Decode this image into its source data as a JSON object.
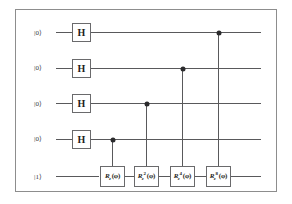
{
  "figure": {
    "kind": "quantum-circuit-diagram",
    "title": "",
    "frame": {
      "border_color": "#8d8d8d",
      "background": "#ffffff"
    },
    "wire_color": "#59595b",
    "gate_border_color": "#6a6a6c",
    "dot_color": "#2b2b2d"
  },
  "qubits": [
    {
      "index": 0,
      "label": "|0⟩",
      "y": 32
    },
    {
      "index": 1,
      "label": "|0⟩",
      "y": 67
    },
    {
      "index": 2,
      "label": "|0⟩",
      "y": 103
    },
    {
      "index": 3,
      "label": "|0⟩",
      "y": 138
    },
    {
      "index": 4,
      "label": "|1⟩",
      "y": 176
    }
  ],
  "hadamard_gates": [
    {
      "id": "h-q0",
      "label": "H",
      "qubit": 0,
      "x": 66,
      "y": 32
    },
    {
      "id": "h-q1",
      "label": "H",
      "qubit": 1,
      "x": 66,
      "y": 67
    },
    {
      "id": "h-q2",
      "label": "H",
      "qubit": 2,
      "x": 66,
      "y": 103
    },
    {
      "id": "h-q3",
      "label": "H",
      "qubit": 3,
      "x": 66,
      "y": 138
    }
  ],
  "controlled_gates": [
    {
      "id": "crz-1",
      "symbol": "R",
      "subscript": "z",
      "superscript": "",
      "argument": "(φ)",
      "full_label": "R_z(φ)",
      "control_qubit": 3,
      "target_qubit": 4,
      "x": 111,
      "control_y": 138,
      "target_y": 176
    },
    {
      "id": "crz-2",
      "symbol": "R",
      "subscript": "z",
      "superscript": "2",
      "argument": "(φ)",
      "full_label": "R_z^2(φ)",
      "control_qubit": 2,
      "target_qubit": 4,
      "x": 145,
      "control_y": 103,
      "target_y": 176
    },
    {
      "id": "crz-3",
      "symbol": "R",
      "subscript": "z",
      "superscript": "4",
      "argument": "(φ)",
      "full_label": "R_z^4(φ)",
      "control_qubit": 1,
      "target_qubit": 4,
      "x": 181,
      "control_y": 67,
      "target_y": 176
    },
    {
      "id": "crz-4",
      "symbol": "R",
      "subscript": "z",
      "superscript": "8",
      "argument": "(φ)",
      "full_label": "R_z^8(φ)",
      "control_qubit": 0,
      "target_qubit": 4,
      "x": 217,
      "control_y": 32,
      "target_y": 176
    }
  ]
}
